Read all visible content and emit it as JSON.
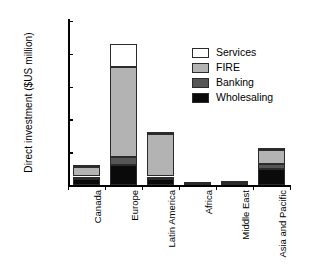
{
  "chart_data": {
    "type": "bar",
    "stacked": true,
    "title": "",
    "xlabel": "",
    "ylabel": "Direct investment ($US million)",
    "ylim": [
      0,
      250000
    ],
    "yticks": [
      0,
      50000,
      100000,
      150000,
      200000,
      250000
    ],
    "ytick_labels": [
      "0",
      "50 000",
      "100 000",
      "150 000",
      "200 000",
      "250 000"
    ],
    "grid": false,
    "legend_position": "upper right",
    "categories": [
      "Canada",
      "Europe",
      "Latin America",
      "Africa",
      "Middle East",
      "Asia and Pacific"
    ],
    "series": [
      {
        "name": "Wholesaling",
        "color": "#0a0a0a",
        "values": [
          9000,
          31000,
          9000,
          700,
          1200,
          24000
        ]
      },
      {
        "name": "Banking",
        "color": "#555555",
        "values": [
          4000,
          11000,
          4000,
          500,
          900,
          8000
        ]
      },
      {
        "name": "FIRE",
        "color": "#b3b3b3",
        "values": [
          15000,
          138000,
          65000,
          1000,
          1200,
          22000
        ]
      },
      {
        "name": "Services",
        "color": "#ffffff",
        "values": [
          3000,
          35000,
          3000,
          300,
          400,
          3000
        ]
      }
    ],
    "totals": [
      31000,
      215000,
      81000,
      2500,
      3700,
      57000
    ]
  },
  "axis": {
    "y_title": "Direct investment ($US million)",
    "tick_0": "0",
    "tick_1": "50 000",
    "tick_2": "100 000",
    "tick_3": "150 000",
    "tick_4": "200 000",
    "tick_5": "250 000"
  },
  "categories": {
    "c0": "Canada",
    "c1": "Europe",
    "c2": "Latin America",
    "c3": "Africa",
    "c4": "Middle East",
    "c5": "Asia and Pacific"
  },
  "legend": {
    "items": [
      {
        "label": "Services",
        "color": "#ffffff"
      },
      {
        "label": "FIRE",
        "color": "#b3b3b3"
      },
      {
        "label": "Banking",
        "color": "#555555"
      },
      {
        "label": "Wholesaling",
        "color": "#0a0a0a"
      }
    ]
  }
}
